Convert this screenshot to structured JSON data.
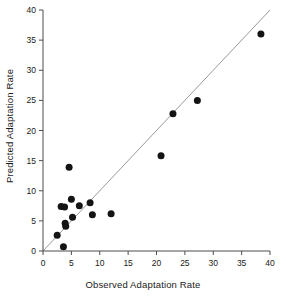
{
  "chart_data": {
    "type": "scatter",
    "title": "",
    "xlabel": "Observed Adaptation Rate",
    "ylabel": "Predicted Adaptation Rate",
    "xlim": [
      0,
      40
    ],
    "ylim": [
      0,
      40
    ],
    "xticks": [
      0,
      5,
      10,
      15,
      20,
      25,
      30,
      35,
      40
    ],
    "yticks": [
      0,
      5,
      10,
      15,
      20,
      25,
      30,
      35,
      40
    ],
    "xtick_labels": [
      "0",
      "5",
      "10",
      "15",
      "20",
      "25",
      "30",
      "35",
      "40"
    ],
    "ytick_labels": [
      "0",
      "5",
      "10",
      "15",
      "20",
      "25",
      "30",
      "35",
      "40"
    ],
    "grid": false,
    "legend": null,
    "marker": "filled-circle",
    "marker_color": "#141414",
    "reference_line": {
      "name": "one-to-one-line",
      "from": [
        0,
        0
      ],
      "to": [
        40,
        40
      ],
      "color": "#9a9a9a"
    },
    "points": [
      {
        "x": 2.5,
        "y": 2.6
      },
      {
        "x": 3.2,
        "y": 7.4
      },
      {
        "x": 3.6,
        "y": 0.7
      },
      {
        "x": 3.8,
        "y": 7.3
      },
      {
        "x": 3.9,
        "y": 4.6
      },
      {
        "x": 4.0,
        "y": 4.1
      },
      {
        "x": 4.6,
        "y": 13.9
      },
      {
        "x": 5.0,
        "y": 8.6
      },
      {
        "x": 5.2,
        "y": 5.6
      },
      {
        "x": 6.4,
        "y": 7.5
      },
      {
        "x": 8.3,
        "y": 8.0
      },
      {
        "x": 8.7,
        "y": 6.0
      },
      {
        "x": 12.0,
        "y": 6.2
      },
      {
        "x": 20.8,
        "y": 15.8
      },
      {
        "x": 22.9,
        "y": 22.8
      },
      {
        "x": 27.2,
        "y": 25.0
      },
      {
        "x": 38.4,
        "y": 36.0
      }
    ]
  }
}
